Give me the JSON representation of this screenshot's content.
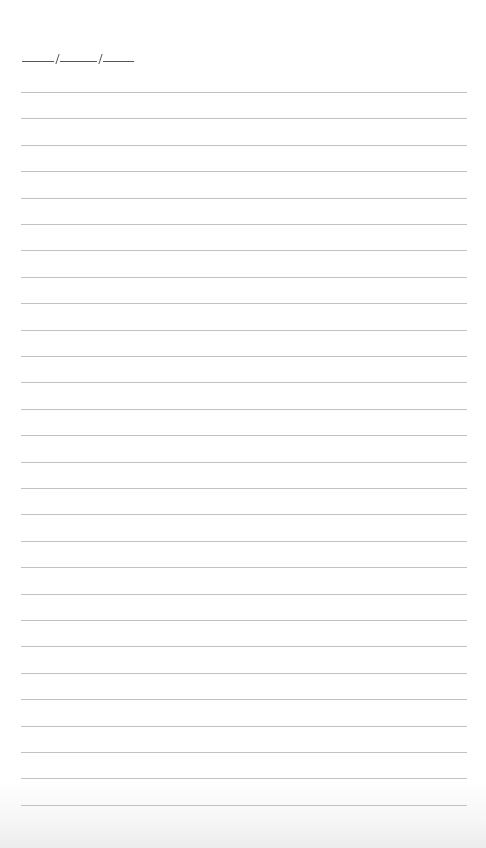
{
  "page": {
    "type": "lined notebook page",
    "background_color": "#ffffff",
    "rule_color": "#c2c2c2",
    "ink_color": "#555555"
  },
  "date_field": {
    "label": "",
    "separator": "/",
    "segments": 3
  },
  "ruled_lines": {
    "count": 28,
    "first_y": 92,
    "spacing": 26.4,
    "left": 21,
    "right": 467
  }
}
